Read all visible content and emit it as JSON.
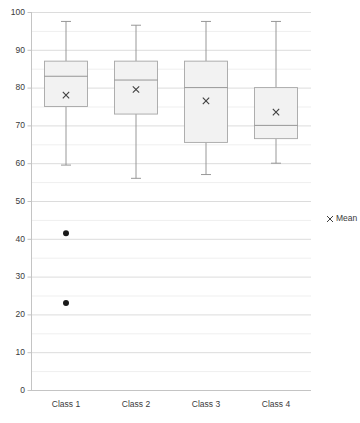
{
  "chart_data": {
    "type": "box",
    "title": "",
    "xlabel": "",
    "ylabel": "",
    "categories": [
      "Class 1",
      "Class 2",
      "Class 3",
      "Class 4"
    ],
    "ylim": [
      0,
      100
    ],
    "ytick_step": 10,
    "yticks": [
      0,
      10,
      20,
      30,
      40,
      50,
      60,
      70,
      80,
      90,
      100
    ],
    "ytick_labels": [
      "0",
      "10",
      "20",
      "30",
      "40",
      "50",
      "60",
      "70",
      "80",
      "90",
      "100"
    ],
    "grid": true,
    "minor_grid": true,
    "legend": {
      "position": "right",
      "entries": [
        {
          "label": "Mean",
          "marker": "x-cross-marker",
          "color": "#404040"
        }
      ]
    },
    "boxes": [
      {
        "category": "Class 1",
        "min": 59.5,
        "q1": 75.0,
        "median": 83.0,
        "q3": 87.0,
        "max": 97.5,
        "mean": 78.0,
        "outliers": [
          41.5,
          23.0
        ]
      },
      {
        "category": "Class 2",
        "min": 56.0,
        "q1": 73.0,
        "median": 82.0,
        "q3": 87.0,
        "max": 96.5,
        "mean": 79.5,
        "outliers": []
      },
      {
        "category": "Class 3",
        "min": 57.0,
        "q1": 65.5,
        "median": 80.0,
        "q3": 87.0,
        "max": 97.5,
        "mean": 76.5,
        "outliers": []
      },
      {
        "category": "Class 4",
        "min": 60.0,
        "q1": 66.5,
        "median": 70.0,
        "q3": 80.0,
        "max": 97.5,
        "mean": 73.5,
        "outliers": []
      }
    ],
    "colors": {
      "box_fill": "#f2f2f2",
      "box_stroke": "#a6a6a6",
      "whisker": "#8c8c8c",
      "median": "#8c8c8c",
      "mean_marker": "#404040",
      "outlier": "#1a1a1a",
      "gridline": "#e3e3e3",
      "axis": "#c4c4c4",
      "text": "#3a3a3a"
    }
  }
}
